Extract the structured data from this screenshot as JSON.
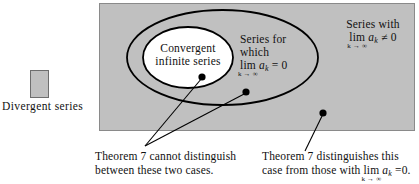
{
  "figure": {
    "type": "venn-set-diagram",
    "colors": {
      "universe_fill": "#c0c0c0",
      "universe_border": "#8a8a8a",
      "inner_fill": "#ffffff",
      "outline": "#000000",
      "text": "#111111"
    }
  },
  "legend": {
    "swatch_name": "gray-square-swatch",
    "label": "Divergent series"
  },
  "regions": [
    {
      "key": "convergent",
      "name": "convergent-infinite-series-region",
      "line1": "Convergent",
      "line2": "infinite series"
    },
    {
      "key": "lim_zero",
      "name": "series-with-limit-zero-region",
      "line1": "Series for",
      "line2": "which",
      "lim_word": "lim",
      "lim_under": "k → ∞",
      "lim_term": "a",
      "lim_sub": "k",
      "lim_relation": "=",
      "lim_value": "0"
    },
    {
      "key": "lim_nonzero",
      "name": "series-with-limit-nonzero-region",
      "line1": "Series with",
      "lim_word": "lim",
      "lim_under": "k → ∞",
      "lim_term": "a",
      "lim_sub": "k",
      "lim_relation": "≠",
      "lim_value": "0"
    }
  ],
  "markers": [
    {
      "name": "dot-convergent-case",
      "x": 202,
      "y": 77
    },
    {
      "name": "dot-lim-zero-case",
      "x": 246,
      "y": 92
    },
    {
      "name": "dot-lim-nonzero-case",
      "x": 323,
      "y": 113
    }
  ],
  "captions": {
    "left": {
      "name": "caption-cannot-distinguish",
      "line1": "Theorem 7 cannot distinguish",
      "line2": "between these two cases."
    },
    "right": {
      "name": "caption-distinguishes",
      "line1": "Theorem 7 distinguishes this",
      "line2_pre": "case from those with ",
      "lim_word": "lim",
      "lim_under": "k → ∞",
      "lim_term": "a",
      "lim_sub": "k",
      "lim_relation": "=",
      "lim_value": "0",
      "line2_post": "."
    }
  }
}
